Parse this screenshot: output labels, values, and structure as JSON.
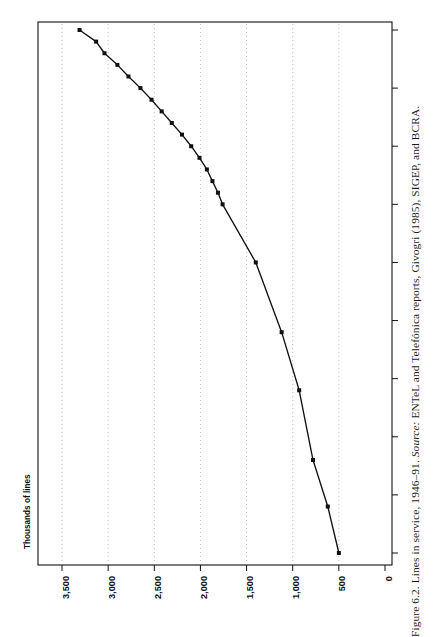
{
  "figure": {
    "caption_prefix": "Figure 6.2. Lines in service, 1946–91. ",
    "caption_source_label": "Source:",
    "caption_source_text": " ENTeL and Telefónica reports, Givogri (1985), SIGEP, and BCRA.",
    "caption_full": "Figure 6.2. Lines in service, 1946–91. Source: ENTeL and Telefónica reports, Givogri (1985), SIGEP, and BCRA.",
    "page_background": "#ffffff",
    "ink_color": "#111111",
    "gridline_color": "#9a9a9a"
  },
  "chart_data": {
    "type": "line",
    "title": "",
    "subtitle": "",
    "xlabel": "",
    "ylabel": "Thousands of lines",
    "orientation": "rotated-90-ccw",
    "grid": "dotted vertical gridlines at each value tick",
    "legend": "none",
    "xlim": [
      1945,
      1992
    ],
    "ylim": [
      0,
      3500
    ],
    "x_tick_labels": [
      "1946",
      "1951",
      "1956",
      "1961",
      "1966",
      "1971",
      "1976",
      "1981",
      "1986",
      "1991"
    ],
    "x_ticks": [
      1946,
      1951,
      1956,
      1961,
      1966,
      1971,
      1976,
      1981,
      1986,
      1991
    ],
    "y_tick_labels": [
      "3,500",
      "3,000",
      "2,500",
      "2,000",
      "1,500",
      "1,000",
      "500",
      "0"
    ],
    "y_ticks": [
      3500,
      3000,
      2500,
      2000,
      1500,
      1000,
      500,
      0
    ],
    "series": [
      {
        "name": "Lines in service",
        "marker": "filled square",
        "x": [
          1946,
          1950,
          1954,
          1960,
          1965,
          1971,
          1976,
          1977,
          1978,
          1979,
          1980,
          1981,
          1982,
          1983,
          1984,
          1985,
          1986,
          1987,
          1988,
          1989,
          1990,
          1991
        ],
        "values": [
          500,
          620,
          780,
          930,
          1120,
          1400,
          1760,
          1810,
          1870,
          1930,
          2010,
          2100,
          2200,
          2310,
          2420,
          2530,
          2650,
          2780,
          2900,
          3040,
          3130,
          3310
        ]
      }
    ]
  },
  "axes": {
    "y_axis_title": "Thousands of lines"
  }
}
